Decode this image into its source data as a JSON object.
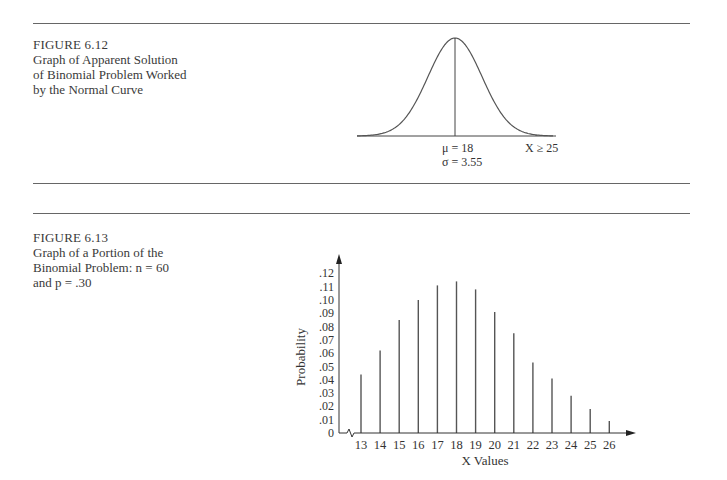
{
  "figures": [
    {
      "number": "FIGURE 6.12",
      "caption_lines": [
        "Graph of Apparent Solution",
        "of Binomial Problem Worked",
        "by the Normal Curve"
      ],
      "labels": {
        "mu": "μ = 18",
        "sigma": "σ = 3.55",
        "x_region": "X ≥ 25"
      }
    },
    {
      "number": "FIGURE 6.13",
      "caption_lines": [
        "Graph of a Portion of the",
        "Binomial Problem: n = 60",
        "and p = .30"
      ],
      "ylabel": "Probability",
      "xlabel": "X Values"
    }
  ],
  "chart_data": [
    {
      "type": "area",
      "title": "Graph of Apparent Solution of Binomial Problem Worked by the Normal Curve",
      "distribution": "normal",
      "mean": 18,
      "std": 3.55,
      "shaded_region": "X >= 25",
      "annotations": [
        "μ = 18",
        "σ = 3.55",
        "X ≥ 25"
      ],
      "grid": false
    },
    {
      "type": "bar",
      "title": "Graph of a Portion of the Binomial Problem: n = 60 and p = .30",
      "xlabel": "X Values",
      "ylabel": "Probability",
      "categories": [
        13,
        14,
        15,
        16,
        17,
        18,
        19,
        20,
        21,
        22,
        23,
        24,
        25,
        26
      ],
      "values": [
        0.044,
        0.062,
        0.085,
        0.1,
        0.111,
        0.114,
        0.108,
        0.091,
        0.075,
        0.053,
        0.041,
        0.028,
        0.018,
        0.009
      ],
      "yticks": [
        "0",
        ".01",
        ".02",
        ".03",
        ".04",
        ".05",
        ".06",
        ".07",
        ".08",
        ".09",
        ".10",
        ".11",
        ".12"
      ],
      "ylim": [
        0,
        0.13
      ],
      "axis_break": true,
      "grid": false
    }
  ]
}
